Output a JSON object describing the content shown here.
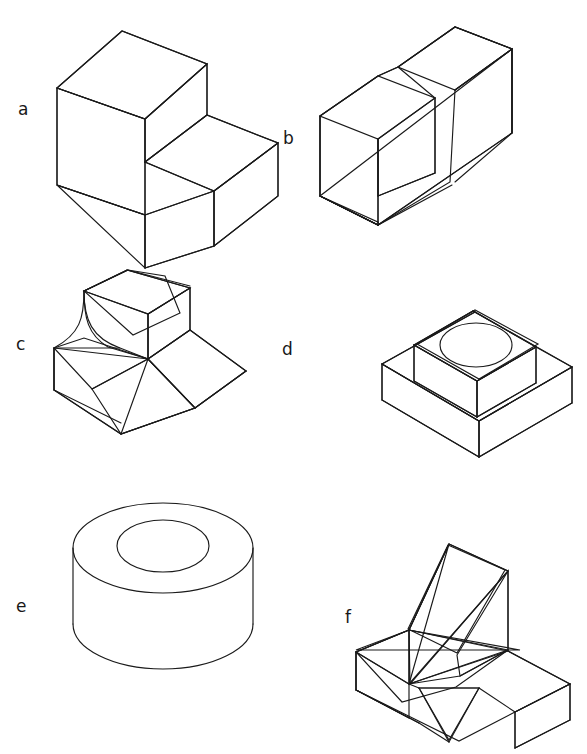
{
  "page": {
    "kind": "technical-drawing-worksheet",
    "background_color": "#ffffff",
    "line_color": "#1a1a1a",
    "width": 587,
    "height": 754,
    "clipped_header_text": "",
    "projection": "isometric"
  },
  "figures": [
    {
      "id": "a",
      "label": "a",
      "name": "l-shaped-step-block",
      "description": "L-shaped step block shown in isometric projection with a single rectangular step cut from the upper front portion",
      "label_position": {
        "x": 18,
        "y": 101
      },
      "faces": 7,
      "has_curves": false,
      "has_hole": false
    },
    {
      "id": "b",
      "label": "b",
      "name": "u-shaped-slotted-block",
      "description": "Rectangular block with a full-width rectangular slot machined through the top forming a U channel",
      "label_position": {
        "x": 283,
        "y": 130
      },
      "faces": 10,
      "has_curves": false,
      "has_hole": false
    },
    {
      "id": "c",
      "label": "c",
      "name": "filleted-stepped-block-with-chamfer",
      "description": "Stepped block with a concave fillet radius on the left upright and an inclined chamfered face on the right",
      "label_position": {
        "x": 16,
        "y": 336
      },
      "faces": 8,
      "has_curves": true,
      "has_hole": false
    },
    {
      "id": "d",
      "label": "d",
      "name": "stepped-square-pedestal-with-hole",
      "description": "Two-tier square pedestal, the upper boss containing a circular through hole in its top face",
      "label_position": {
        "x": 282,
        "y": 341
      },
      "faces": 9,
      "has_curves": true,
      "has_hole": true
    },
    {
      "id": "e",
      "label": "e",
      "name": "hollow-cylinder-bushing",
      "description": "Hollow cylinder or bushing with a concentric circular bore through the top face",
      "label_position": {
        "x": 16,
        "y": 598
      },
      "faces": 3,
      "has_curves": true,
      "has_hole": true
    },
    {
      "id": "f",
      "label": "f",
      "name": "angled-rib-on-base-plate",
      "description": "Inclined triangular rib rising from a rectangular base plate, with a V-shaped notch cut in the front edge of the base",
      "label_position": {
        "x": 345,
        "y": 609
      },
      "faces": 10,
      "has_curves": false,
      "has_hole": false
    }
  ]
}
